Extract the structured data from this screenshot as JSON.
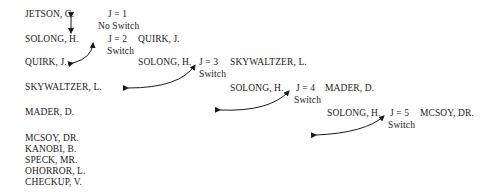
{
  "list": {
    "items": [
      "JETSON, G.",
      "SOLONG, H.",
      "QUIRK, J.",
      "SKYWALTZER, L.",
      "MADER, D.",
      "MCSOY, DR.",
      "KANOBI, B.",
      "SPECK, MR.",
      "OHORROR, L.",
      "CHECKUP, V."
    ]
  },
  "steps": [
    {
      "j_label": "J = 1",
      "key": "",
      "compare": "",
      "result": "No Switch"
    },
    {
      "j_label": "J = 2",
      "key": "",
      "compare": "QUIRK, J.",
      "result": "Switch"
    },
    {
      "j_label": "J = 3",
      "key": "SOLONG, H.",
      "compare": "SKYWALTZER, L.",
      "result": "Switch"
    },
    {
      "j_label": "J = 4",
      "key": "SOLONG, H.",
      "compare": "MADER, D.",
      "result": "Switch"
    },
    {
      "j_label": "J = 5",
      "key": "SOLONG, H.",
      "compare": "MCSOY, DR.",
      "result": "Switch"
    }
  ],
  "colors": {
    "text": "#1a1a1a",
    "arrow": "#1a1a1a",
    "background": "#ffffff"
  }
}
